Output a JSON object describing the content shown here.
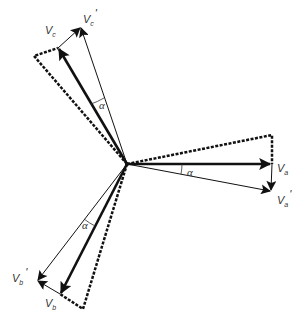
{
  "diagram": {
    "type": "phasor-diagram",
    "colors": {
      "stroke": "#111111",
      "text": "#333333",
      "background": "#ffffff"
    },
    "origin": [
      127,
      164
    ],
    "phasors": [
      {
        "name": "Va",
        "label_main": "V",
        "label_sub": "a",
        "prime": "",
        "tip": [
          271,
          164
        ],
        "style": "thick"
      },
      {
        "name": "Va'",
        "label_main": "V",
        "label_sub": "a",
        "prime": "'",
        "tip": [
          271,
          191
        ],
        "style": "thin"
      },
      {
        "name": "Vb",
        "label_main": "V",
        "label_sub": "b",
        "prime": "",
        "tip": [
          60,
          294
        ],
        "style": "thick"
      },
      {
        "name": "Vb'",
        "label_main": "V",
        "label_sub": "b",
        "prime": "'",
        "tip": [
          37,
          280
        ],
        "style": "thin"
      },
      {
        "name": "Vc",
        "label_main": "V",
        "label_sub": "c",
        "prime": "",
        "tip": [
          58,
          48
        ],
        "style": "thick"
      },
      {
        "name": "Vc'",
        "label_main": "V",
        "label_sub": "c",
        "prime": "'",
        "tip": [
          81,
          27
        ],
        "style": "thin"
      }
    ],
    "angle_label": "α",
    "angles": [
      {
        "between": [
          "Va",
          "Va'"
        ],
        "label": "α"
      },
      {
        "between": [
          "Vb",
          "Vb'"
        ],
        "label": "α"
      },
      {
        "between": [
          "Vc",
          "Vc'"
        ],
        "label": "α"
      }
    ],
    "dashed_triangles": [
      {
        "phase": "a",
        "corner": [
          272,
          135
        ]
      },
      {
        "phase": "b",
        "corner": [
          83,
          309
        ]
      },
      {
        "phase": "c",
        "corner": [
          34,
          56
        ]
      }
    ]
  }
}
